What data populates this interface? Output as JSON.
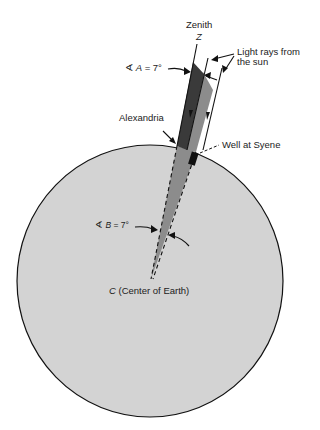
{
  "diagram": {
    "labels": {
      "zenith": "Zenith",
      "zenith_symbol": "Z",
      "light_rays": "Light rays from\nthe sun",
      "light_rays_line1": "Light rays from",
      "light_rays_line2": "the sun",
      "angle_a_symbol": "∢",
      "angle_a_name": "A",
      "angle_a_value": "= 7°",
      "alexandria": "Alexandria",
      "well": "Well at Syene",
      "angle_b_symbol": "∢",
      "angle_b_name": "B",
      "angle_b_value": "= 7°",
      "center_symbol": "C",
      "center_text": "(Center of Earth)"
    },
    "angles": {
      "A_degrees": 7,
      "B_degrees": 7
    },
    "colors": {
      "earth_fill": "#d3d3d3",
      "shadow_wedge": "#3a3a3a",
      "sun_band": "#8c8c8c",
      "lines": "#111111",
      "background": "#ffffff"
    }
  }
}
